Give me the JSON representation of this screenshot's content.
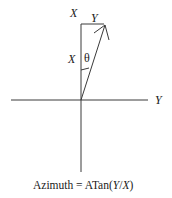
{
  "diagram": {
    "axes": {
      "vertical_label": "X",
      "horizontal_label": "Y"
    },
    "vector": {
      "x_component_label": "X",
      "y_component_label": "Y",
      "angle_label": "θ"
    },
    "caption": {
      "prefix": "Azimuth = ATan(",
      "num": "Y",
      "slash": "/",
      "den": "X",
      "suffix": ")"
    },
    "colors": {
      "line": "#3a3a3a",
      "background": "#ffffff"
    }
  }
}
